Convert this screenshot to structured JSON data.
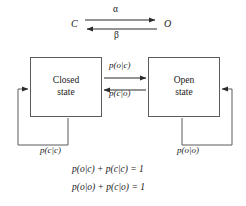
{
  "diagram": {
    "reaction": {
      "left_species": "C",
      "right_species": "O",
      "forward_rate": "α",
      "reverse_rate": "β",
      "forward_arrow_icon": "arrow-right-icon",
      "reverse_arrow_icon": "arrow-left-icon"
    },
    "states": [
      {
        "id": "closed",
        "line1": "Closed",
        "line2": "state",
        "self_loop_label": "p(c|c)"
      },
      {
        "id": "open",
        "line1": "Open",
        "line2": "state",
        "self_loop_label": "p(o|o)"
      }
    ],
    "transitions": [
      {
        "id": "closed-to-open",
        "label": "p(o|c)",
        "direction": "right",
        "arrow_icon": "arrow-right-icon"
      },
      {
        "id": "open-to-closed",
        "label": "p(c|o)",
        "direction": "left",
        "arrow_icon": "arrow-left-icon"
      }
    ],
    "equations": [
      {
        "id": "normalization-closed",
        "text": "p(o|c) + p(c|c) = 1",
        "terms": [
          "p(o|c)",
          "+",
          "p(c|c)",
          "=",
          "1"
        ]
      },
      {
        "id": "normalization-open",
        "text": "p(o|o) + p(c|o) = 1",
        "terms": [
          "p(o|o)",
          "+",
          "p(c|o)",
          "=",
          "1"
        ]
      }
    ],
    "colors": {
      "background": "#ffffff",
      "stroke": "#5b5b5b",
      "text": "#1a1a1a"
    }
  }
}
